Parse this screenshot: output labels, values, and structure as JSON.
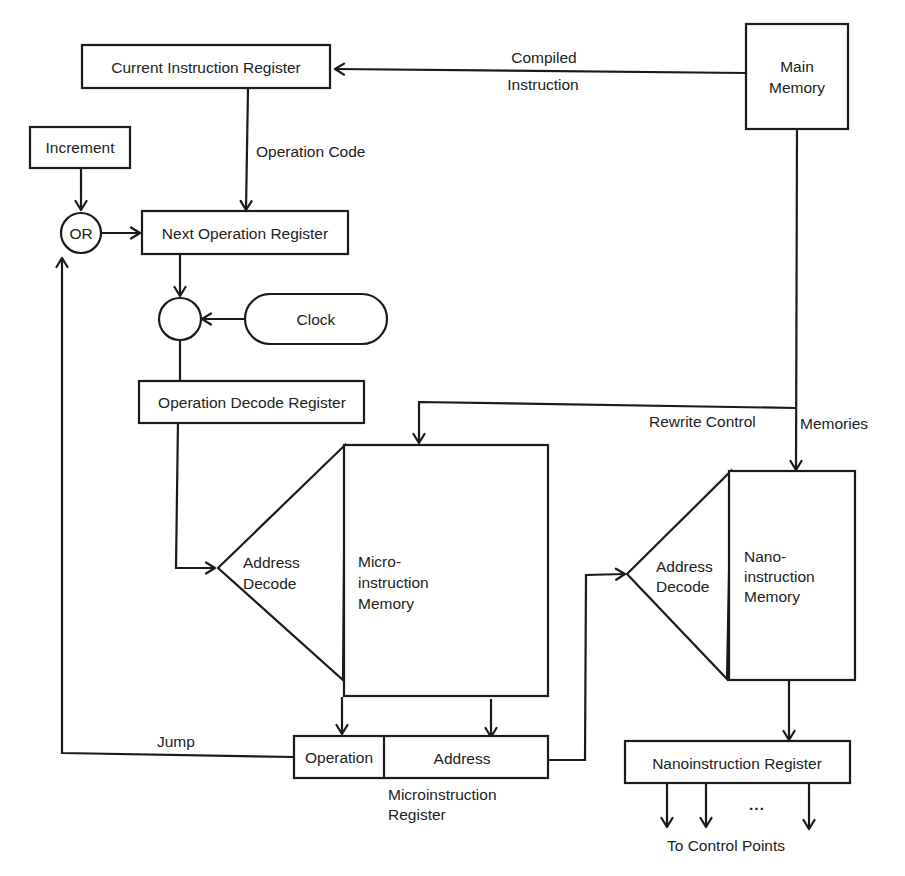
{
  "diagram": {
    "nodes": {
      "main_memory": {
        "line1": "Main",
        "line2": "Memory"
      },
      "current_instruction_register": {
        "label": "Current Instruction Register"
      },
      "increment": {
        "label": "Increment"
      },
      "or_gate": {
        "label": "OR"
      },
      "next_operation_register": {
        "label": "Next Operation Register"
      },
      "clock_gate": {
        "label": ""
      },
      "clock": {
        "label": "Clock"
      },
      "operation_decode_register": {
        "label": "Operation Decode Register"
      },
      "micro_address_decode": {
        "line1": "Address",
        "line2": "Decode"
      },
      "microinstruction_memory": {
        "line1": "Micro-",
        "line2": "instruction",
        "line3": "Memory"
      },
      "microinstruction_register": {
        "operation_field": "Operation",
        "address_field": "Address",
        "caption_line1": "Microinstruction",
        "caption_line2": "Register"
      },
      "nano_address_decode": {
        "line1": "Address",
        "line2": "Decode"
      },
      "nanoinstruction_memory": {
        "line1": "Nano-",
        "line2": "instruction",
        "line3": "Memory"
      },
      "nanoinstruction_register": {
        "label": "Nanoinstruction Register"
      }
    },
    "edge_labels": {
      "compiled_instruction_line1": "Compiled",
      "compiled_instruction_line2": "Instruction",
      "operation_code": "Operation Code",
      "rewrite_control": "Rewrite Control",
      "memories": "Memories",
      "jump": "Jump",
      "ellipsis": "...",
      "to_control_points": "To Control Points"
    },
    "edges": [
      {
        "from": "Main Memory",
        "to": "Current Instruction Register",
        "label": "Compiled Instruction"
      },
      {
        "from": "Current Instruction Register",
        "to": "Next Operation Register",
        "label": "Operation Code"
      },
      {
        "from": "Increment",
        "to": "OR"
      },
      {
        "from": "OR",
        "to": "Next Operation Register"
      },
      {
        "from": "Next Operation Register",
        "to": "Clock gate"
      },
      {
        "from": "Clock",
        "to": "Clock gate"
      },
      {
        "from": "Clock gate",
        "to": "Operation Decode Register"
      },
      {
        "from": "Operation Decode Register",
        "to": "Micro Address Decode"
      },
      {
        "from": "Main Memory",
        "to": "Microinstruction Memory",
        "label": "Rewrite Control"
      },
      {
        "from": "Main Memory",
        "to": "Nanoinstruction Memory",
        "label": "Memories"
      },
      {
        "from": "Microinstruction Memory",
        "to": "Operation field"
      },
      {
        "from": "Microinstruction Memory",
        "to": "Address field"
      },
      {
        "from": "Operation field",
        "to": "OR",
        "label": "Jump"
      },
      {
        "from": "Address field",
        "to": "Nano Address Decode"
      },
      {
        "from": "Nanoinstruction Memory",
        "to": "Nanoinstruction Register"
      },
      {
        "from": "Nanoinstruction Register",
        "to": "Control Points",
        "label": "To Control Points"
      }
    ],
    "colors": {
      "stroke": "#1a1a1a",
      "text": "#222222",
      "background": "#ffffff"
    }
  }
}
